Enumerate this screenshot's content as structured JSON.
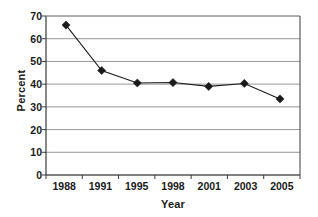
{
  "chart_data": {
    "type": "line",
    "title": "",
    "xlabel": "Year",
    "ylabel": "Percent",
    "categories": [
      "1988",
      "1991",
      "1995",
      "1998",
      "2001",
      "2003",
      "2005"
    ],
    "values": [
      66,
      46,
      40.5,
      40.7,
      39,
      40.3,
      33.5
    ],
    "series": [
      {
        "name": "Percent",
        "values": [
          66,
          46,
          40.5,
          40.7,
          39,
          40.3,
          33.5
        ]
      }
    ],
    "ylim": [
      0,
      70
    ],
    "ytick_labels": [
      "0",
      "10",
      "20",
      "30",
      "40",
      "50",
      "60",
      "70"
    ],
    "ytick_values": [
      0,
      10,
      20,
      30,
      40,
      50,
      60,
      70
    ],
    "ytick_step": 10,
    "grid": "horizontal",
    "legend": "none",
    "marker": "diamond",
    "colors": {
      "line": "#1a1a1a",
      "marker": "#1a1a1a",
      "gridline": "#8c8c8c",
      "axis": "#4d4d4d",
      "text": "#1a1a1a",
      "background": "#ffffff"
    }
  }
}
